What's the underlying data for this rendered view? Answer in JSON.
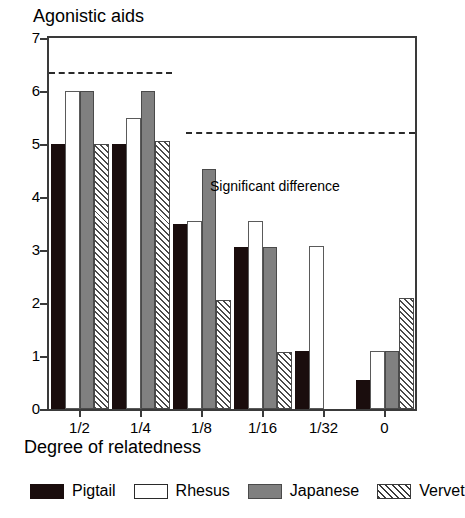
{
  "chart_data": {
    "type": "bar",
    "title": "Agonistic aids",
    "xlabel": "Degree of relatedness",
    "ylabel": "",
    "categories": [
      "1/2",
      "1/4",
      "1/8",
      "1/16",
      "1/32",
      "0"
    ],
    "series": [
      {
        "name": "Pigtail",
        "color": "#1a0d0d",
        "fill": "solid-black",
        "values": [
          5.0,
          5.0,
          3.5,
          3.05,
          1.1,
          0.55
        ]
      },
      {
        "name": "Rhesus",
        "color": "#ffffff",
        "fill": "open-white",
        "values": [
          6.0,
          5.5,
          3.55,
          3.55,
          3.07,
          1.1
        ]
      },
      {
        "name": "Japanese",
        "color": "#808080",
        "fill": "solid-gray",
        "values": [
          6.0,
          6.0,
          4.53,
          3.05,
          null,
          1.1
        ]
      },
      {
        "name": "Vervet",
        "color": "#ffffff",
        "fill": "hatched",
        "values": [
          5.0,
          5.05,
          2.05,
          1.07,
          null,
          2.1
        ]
      }
    ],
    "ylim": [
      0,
      7
    ],
    "yticks": [
      0,
      1,
      2,
      3,
      4,
      5,
      6,
      7
    ],
    "ytick_labels": [
      "0",
      "1",
      "2",
      "3",
      "4",
      "5",
      "6",
      "7"
    ],
    "grid": false,
    "legend_position": "bottom",
    "annotations": [
      {
        "name": "significant-difference-label",
        "text": "Significant difference",
        "x_frac": 0.44,
        "y_value": 4.35
      }
    ],
    "reference_lines": [
      {
        "name": "significance-line-left",
        "y_value": 6.35,
        "x_start_frac": 0.0,
        "x_end_frac": 0.335,
        "style": "dashed"
      },
      {
        "name": "significance-line-right",
        "y_value": 5.22,
        "x_start_frac": 0.375,
        "x_end_frac": 1.0,
        "style": "dashed"
      }
    ]
  },
  "legend": {
    "items": [
      {
        "label": "Pigtail",
        "swatch": "pigtail"
      },
      {
        "label": "Rhesus",
        "swatch": "rhesus"
      },
      {
        "label": "Japanese",
        "swatch": "japanese"
      },
      {
        "label": "Vervet",
        "swatch": "vervet"
      }
    ]
  }
}
